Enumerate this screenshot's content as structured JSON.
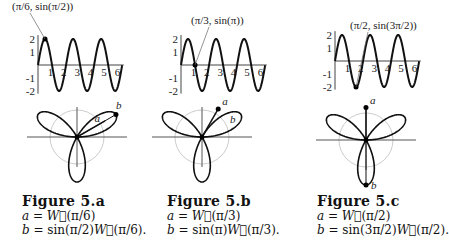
{
  "figures": [
    {
      "id": "5.a",
      "title": "Figure 5.a",
      "point_label": "(π/6, sin(π/2))",
      "point_theta": 0.5236,
      "sin_arg": "π/2",
      "sin_value": 1,
      "vector_a_label": "a",
      "vector_b_label": "b",
      "eq_a": "a = W⃗(π/6)",
      "eq_b": "b = sin(π/2)W⃗(π/6)."
    },
    {
      "id": "5.b",
      "title": "Figure 5.b",
      "point_label": "(π/3, sin(π))",
      "point_theta": 1.0472,
      "sin_arg": "π",
      "sin_value": 0,
      "vector_a_label": "a",
      "vector_b_label": "b",
      "eq_a": "a = W⃗(π/3)",
      "eq_b": "b = sin(π)W⃗(π/3)."
    },
    {
      "id": "5.c",
      "title": "Figure 5.c",
      "point_label": "(π/2, sin(3π/2))",
      "point_theta": 1.5708,
      "sin_arg": "3π/2",
      "sin_value": -1,
      "vector_a_label": "a",
      "vector_b_label": "b",
      "eq_a": "a = W⃗(π/2)",
      "eq_b": "b = sin(3π/2)W⃗(π/2)."
    }
  ],
  "graph": {
    "function": "2 sin(3θ)",
    "x_ticks": [
      "1",
      "2",
      "3",
      "4",
      "5",
      "6"
    ],
    "y_ticks": [
      "2",
      "1",
      "-1",
      "-2"
    ],
    "xlim": [
      0,
      6.3
    ],
    "ylim": [
      -2,
      2
    ]
  },
  "rose": {
    "function": "r = sin(3θ)",
    "petals": 3
  }
}
